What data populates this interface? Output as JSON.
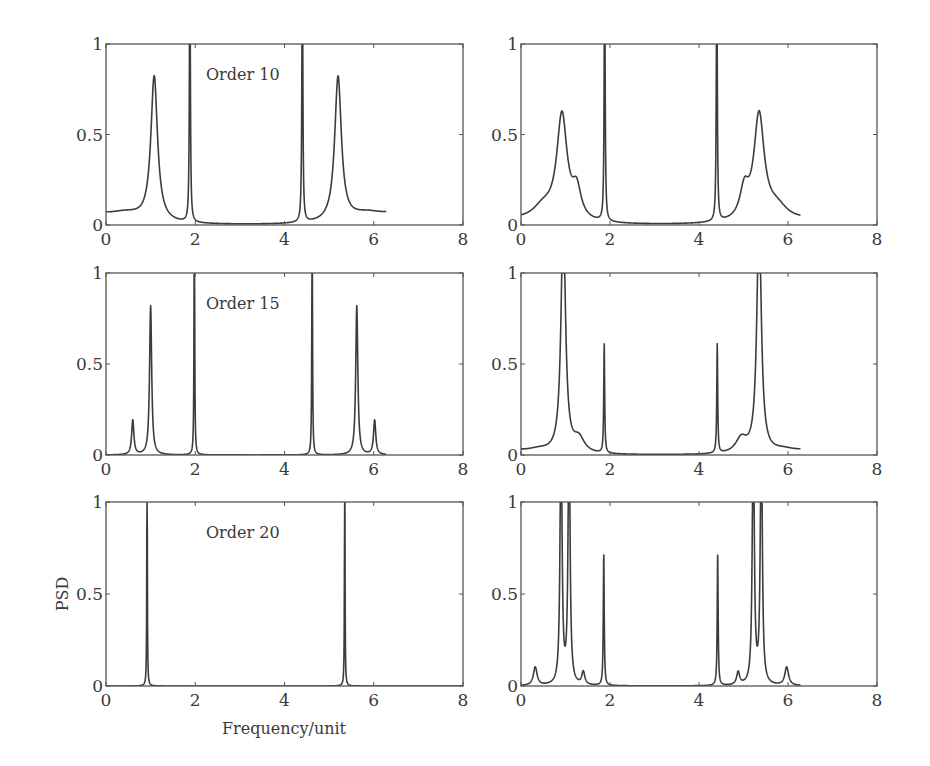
{
  "figure": {
    "ylabel": "PSD",
    "xlabel": "Frequency/unit"
  },
  "chart_data": [
    {
      "type": "line",
      "panel": "row1-left",
      "annotation": "Order 10",
      "xlim": [
        0,
        8
      ],
      "ylim": [
        0,
        1
      ],
      "xticks": [
        "0",
        "2",
        "4",
        "6",
        "8"
      ],
      "yticks": [
        "0",
        "0.5",
        "1"
      ],
      "xlabel": "",
      "ylabel": "",
      "x_extent": [
        0,
        6.28
      ],
      "baseline": 0.0,
      "peaks": [
        {
          "x": 1.08,
          "height": 0.8,
          "width": 0.09
        },
        {
          "x": 0.45,
          "height": 0.05,
          "width": 0.5
        },
        {
          "x": 1.88,
          "height": 1.6,
          "width": 0.012
        },
        {
          "x": 4.4,
          "height": 1.6,
          "width": 0.012
        },
        {
          "x": 5.2,
          "height": 0.8,
          "width": 0.09
        },
        {
          "x": 5.85,
          "height": 0.05,
          "width": 0.5
        }
      ],
      "floor_near_edges": 0.04
    },
    {
      "type": "line",
      "panel": "row1-right",
      "annotation": "",
      "xlim": [
        0,
        8
      ],
      "ylim": [
        0,
        1
      ],
      "xticks": [
        "0",
        "2",
        "4",
        "6",
        "8"
      ],
      "yticks": [
        "0",
        "0.5",
        "1"
      ],
      "xlabel": "",
      "ylabel": "",
      "x_extent": [
        0,
        6.28
      ],
      "baseline": 0.0,
      "peaks": [
        {
          "x": 0.92,
          "height": 0.58,
          "width": 0.14
        },
        {
          "x": 1.25,
          "height": 0.16,
          "width": 0.12
        },
        {
          "x": 0.5,
          "height": 0.08,
          "width": 0.3
        },
        {
          "x": 1.88,
          "height": 1.6,
          "width": 0.012
        },
        {
          "x": 4.4,
          "height": 1.6,
          "width": 0.012
        },
        {
          "x": 5.35,
          "height": 0.58,
          "width": 0.14
        },
        {
          "x": 5.02,
          "height": 0.16,
          "width": 0.12
        },
        {
          "x": 5.75,
          "height": 0.08,
          "width": 0.3
        }
      ],
      "floor_near_edges": 0.02
    },
    {
      "type": "line",
      "panel": "row2-left",
      "annotation": "Order 15",
      "xlim": [
        0,
        8
      ],
      "ylim": [
        0,
        1
      ],
      "xticks": [
        "0",
        "2",
        "4",
        "6",
        "8"
      ],
      "yticks": [
        "0",
        "0.5",
        "1"
      ],
      "xlabel": "",
      "ylabel": "",
      "x_extent": [
        0,
        6.28
      ],
      "baseline": 0.0,
      "peaks": [
        {
          "x": 0.6,
          "height": 0.19,
          "width": 0.03
        },
        {
          "x": 1.0,
          "height": 0.82,
          "width": 0.028
        },
        {
          "x": 1.98,
          "height": 1.6,
          "width": 0.008
        },
        {
          "x": 4.62,
          "height": 1.6,
          "width": 0.008
        },
        {
          "x": 5.62,
          "height": 0.82,
          "width": 0.028
        },
        {
          "x": 6.02,
          "height": 0.19,
          "width": 0.03
        }
      ],
      "floor_near_edges": 0.0
    },
    {
      "type": "line",
      "panel": "row2-right",
      "annotation": "",
      "xlim": [
        0,
        8
      ],
      "ylim": [
        0,
        1
      ],
      "xticks": [
        "0",
        "2",
        "4",
        "6",
        "8"
      ],
      "yticks": [
        "0",
        "0.5",
        "1"
      ],
      "xlabel": "",
      "ylabel": "",
      "x_extent": [
        0,
        6.28
      ],
      "baseline": 0.0,
      "peaks": [
        {
          "x": 0.95,
          "height": 1.3,
          "width": 0.06
        },
        {
          "x": 1.3,
          "height": 0.08,
          "width": 0.15
        },
        {
          "x": 0.4,
          "height": 0.02,
          "width": 0.3
        },
        {
          "x": 1.87,
          "height": 0.6,
          "width": 0.012
        },
        {
          "x": 4.41,
          "height": 0.6,
          "width": 0.012
        },
        {
          "x": 5.35,
          "height": 1.3,
          "width": 0.06
        },
        {
          "x": 4.95,
          "height": 0.08,
          "width": 0.15
        },
        {
          "x": 5.9,
          "height": 0.02,
          "width": 0.3
        }
      ],
      "floor_near_edges": 0.02
    },
    {
      "type": "line",
      "panel": "row3-left",
      "annotation": "Order 20",
      "xlim": [
        0,
        8
      ],
      "ylim": [
        0,
        1
      ],
      "xticks": [
        "0",
        "2",
        "4",
        "6",
        "8"
      ],
      "yticks": [
        "0",
        "0.5",
        "1"
      ],
      "xlabel": "Frequency/unit",
      "ylabel": "PSD",
      "x_extent": [
        0,
        8
      ],
      "baseline": 0.0,
      "peaks": [
        {
          "x": 0.92,
          "height": 1.6,
          "width": 0.006
        },
        {
          "x": 5.35,
          "height": 1.6,
          "width": 0.006
        }
      ],
      "floor_near_edges": 0.0
    },
    {
      "type": "line",
      "panel": "row3-right",
      "annotation": "",
      "xlim": [
        0,
        8
      ],
      "ylim": [
        0,
        1
      ],
      "xticks": [
        "0",
        "2",
        "4",
        "6",
        "8"
      ],
      "yticks": [
        "0",
        "0.5",
        "1"
      ],
      "xlabel": "",
      "ylabel": "",
      "x_extent": [
        0,
        6.28
      ],
      "baseline": 0.0,
      "peaks": [
        {
          "x": 0.32,
          "height": 0.1,
          "width": 0.05
        },
        {
          "x": 0.9,
          "height": 1.5,
          "width": 0.025
        },
        {
          "x": 1.08,
          "height": 1.5,
          "width": 0.025
        },
        {
          "x": 1.4,
          "height": 0.07,
          "width": 0.04
        },
        {
          "x": 1.86,
          "height": 0.72,
          "width": 0.012
        },
        {
          "x": 4.42,
          "height": 0.72,
          "width": 0.012
        },
        {
          "x": 4.88,
          "height": 0.07,
          "width": 0.04
        },
        {
          "x": 5.22,
          "height": 1.5,
          "width": 0.025
        },
        {
          "x": 5.4,
          "height": 1.5,
          "width": 0.025
        },
        {
          "x": 5.97,
          "height": 0.1,
          "width": 0.05
        }
      ],
      "floor_near_edges": 0.0
    }
  ]
}
